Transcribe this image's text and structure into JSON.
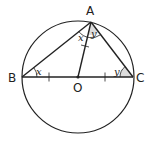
{
  "diagram": {
    "type": "geometry",
    "points": {
      "A": {
        "label": "A",
        "x": 91,
        "y": 22
      },
      "B": {
        "label": "B",
        "x": 22,
        "y": 77
      },
      "C": {
        "label": "C",
        "x": 133,
        "y": 77
      },
      "O": {
        "label": "O",
        "x": 78,
        "y": 77
      }
    },
    "circle": {
      "cx": 78,
      "cy": 77,
      "r": 56
    },
    "angles": {
      "angle_B": "x",
      "angle_BAO": "x",
      "angle_OAC": "y",
      "angle_C": "y"
    },
    "colors": {
      "line": "#222222",
      "shade": "#d9d9d9",
      "background": "#ffffff"
    }
  }
}
